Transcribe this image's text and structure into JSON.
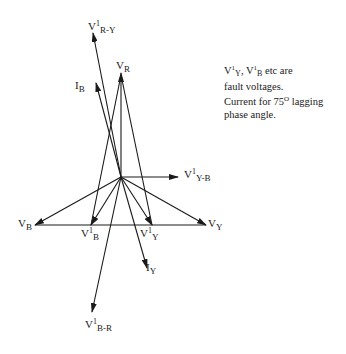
{
  "diagram": {
    "origin": [
      121,
      177
    ],
    "colors": {
      "line": "#1a1a1a",
      "background": "#ffffff"
    },
    "phasors": [
      {
        "id": "VR",
        "from": [
          121,
          177
        ],
        "to": [
          121,
          73
        ]
      },
      {
        "id": "VB",
        "from": [
          121,
          177
        ],
        "to": [
          35,
          225
        ]
      },
      {
        "id": "VY",
        "from": [
          121,
          177
        ],
        "to": [
          206,
          225
        ]
      },
      {
        "id": "V1B",
        "from": [
          121,
          177
        ],
        "to": [
          91,
          225
        ]
      },
      {
        "id": "V1Y",
        "from": [
          121,
          177
        ],
        "to": [
          152,
          225
        ]
      },
      {
        "id": "V1RY",
        "from": [
          121,
          177
        ],
        "to": [
          93,
          33
        ]
      },
      {
        "id": "IB",
        "from": [
          121,
          177
        ],
        "to": [
          96,
          83
        ]
      },
      {
        "id": "IY",
        "from": [
          121,
          177
        ],
        "to": [
          147,
          268
        ]
      },
      {
        "id": "V1YB",
        "from": [
          121,
          177
        ],
        "to": [
          178,
          177
        ]
      },
      {
        "id": "V1BR",
        "from": [
          121,
          177
        ],
        "to": [
          92,
          312
        ]
      }
    ],
    "lines": [
      {
        "id": "base",
        "from": [
          35,
          225
        ],
        "to": [
          206,
          225
        ]
      },
      {
        "id": "V1B-VR",
        "from": [
          91,
          225
        ],
        "to": [
          121,
          73
        ]
      },
      {
        "id": "V1Y-VR",
        "from": [
          152,
          225
        ],
        "to": [
          121,
          73
        ]
      }
    ],
    "labels": {
      "VR": {
        "main": "V",
        "sup": "",
        "sub": "R"
      },
      "VB": {
        "main": "V",
        "sup": "",
        "sub": "B"
      },
      "VY": {
        "main": "V",
        "sup": "",
        "sub": "Y"
      },
      "V1B": {
        "main": "V",
        "sup": "1",
        "sub": "B"
      },
      "V1Y": {
        "main": "V",
        "sup": "1",
        "sub": "Y"
      },
      "V1RY": {
        "main": "V",
        "sup": "1",
        "sub": "R-Y"
      },
      "IB": {
        "main": "I",
        "sup": "",
        "sub": "B"
      },
      "IY": {
        "main": "I",
        "sup": "",
        "sub": "Y"
      },
      "V1YB": {
        "main": "V",
        "sup": "1",
        "sub": "Y-B"
      },
      "V1BR": {
        "main": "V",
        "sup": "1",
        "sub": "B-R"
      }
    }
  },
  "note": {
    "line1_v1": "V",
    "line1_sup1": "1",
    "line1_sub1": "Y",
    "line1_sep": ", V",
    "line1_sup2": "1",
    "line1_sub2": "B",
    "line1_rest": " etc are",
    "line2": "fault voltages.",
    "line3_pre": "Current for 75",
    "line3_sup": "O",
    "line3_post": " lagging",
    "line4": "phase angle."
  }
}
